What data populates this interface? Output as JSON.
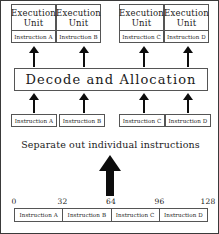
{
  "figure": {
    "title": "Separate out individual instructions",
    "caption": "Separate out individual instructions",
    "decode_label": "Decode and Allocation",
    "border_color": "#3a3a3a",
    "line_color": "#555555",
    "arrow_color": "#0d0d0d",
    "background": "#ffffff"
  },
  "execution_units": [
    {
      "title_line1": "Execution",
      "title_line2": "Unit",
      "instruction": "Instruction A",
      "left": 10,
      "top": 3,
      "width": 45,
      "height": 39
    },
    {
      "title_line1": "Execution",
      "title_line2": "Unit",
      "instruction": "Instruction B",
      "left": 55,
      "top": 3,
      "width": 45,
      "height": 39
    },
    {
      "title_line1": "Execution",
      "title_line2": "Unit",
      "instruction": "Instruction C",
      "left": 118,
      "top": 3,
      "width": 45,
      "height": 39
    },
    {
      "title_line1": "Execution",
      "title_line2": "Unit",
      "instruction": "Instruction D",
      "left": 163,
      "top": 3,
      "width": 45,
      "height": 39
    }
  ],
  "arrows_to_units": [
    {
      "center_x": 33,
      "top": 45,
      "height": 21
    },
    {
      "center_x": 83,
      "top": 45,
      "height": 21
    },
    {
      "center_x": 143,
      "top": 45,
      "height": 21
    },
    {
      "center_x": 187,
      "top": 45,
      "height": 21
    }
  ],
  "arrows_to_decode": [
    {
      "center_x": 33,
      "top": 92,
      "height": 20
    },
    {
      "center_x": 83,
      "top": 92,
      "height": 20
    },
    {
      "center_x": 143,
      "top": 92,
      "height": 20
    },
    {
      "center_x": 187,
      "top": 92,
      "height": 20
    }
  ],
  "decoded_instructions": [
    {
      "label": "Instruction A",
      "left": 10,
      "top": 113,
      "width": 46
    },
    {
      "label": "Instruction B",
      "left": 58,
      "top": 113,
      "width": 46
    },
    {
      "label": "Instruction C",
      "left": 118,
      "top": 113,
      "width": 46
    },
    {
      "label": "Instruction D",
      "left": 164,
      "top": 113,
      "width": 46
    }
  ],
  "big_arrow": {
    "name": "separate-out-arrow",
    "direction": "up"
  },
  "axis": {
    "ticks": [
      {
        "label": "0",
        "value": 0,
        "pos_pct": 0
      },
      {
        "label": "32",
        "value": 32,
        "pos_pct": 25
      },
      {
        "label": "64",
        "value": 64,
        "pos_pct": 50
      },
      {
        "label": "96",
        "value": 96,
        "pos_pct": 75
      },
      {
        "label": "128",
        "value": 128,
        "pos_pct": 100
      }
    ],
    "min": 0,
    "max": 128,
    "unit_hint": "bits"
  },
  "packed_instruction_bar": {
    "cells": [
      {
        "label": "Instruction A",
        "start": 0,
        "end": 32
      },
      {
        "label": "Instruction B",
        "start": 32,
        "end": 64
      },
      {
        "label": "Instruction C",
        "start": 64,
        "end": 96
      },
      {
        "label": "Instruction D",
        "start": 96,
        "end": 128
      }
    ]
  }
}
